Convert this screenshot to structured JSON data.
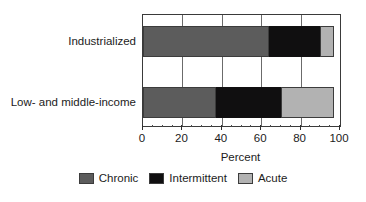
{
  "chart_data": {
    "type": "bar",
    "orientation": "horizontal",
    "stacked": true,
    "title": "",
    "subtitle": "",
    "xlabel": "Percent",
    "ylabel": "",
    "xlim": [
      0,
      100
    ],
    "xticks": [
      0,
      20,
      40,
      60,
      80,
      100
    ],
    "xticklabels": [
      "0",
      "20",
      "40",
      "60",
      "80",
      "100"
    ],
    "minor_tick_step": 5,
    "grid": "vertical-major-only",
    "legend_position": "bottom-center",
    "categories": [
      "Industrialized",
      "Low- and middle-income"
    ],
    "series": [
      {
        "name": "Chronic",
        "color": "#5c5c5c",
        "values": [
          64,
          37
        ]
      },
      {
        "name": "Intermittent",
        "color": "#100f10",
        "values": [
          26,
          33
        ]
      },
      {
        "name": "Acute",
        "color": "#b2b2b2",
        "values": [
          7,
          27
        ]
      }
    ],
    "segment_boundaries": {
      "Industrialized": [
        0,
        64,
        90,
        97
      ],
      "Low- and middle-income": [
        0,
        37,
        70,
        97
      ]
    },
    "totals": [
      97,
      97
    ]
  },
  "axis": {
    "x_title": "Percent",
    "tick_labels": [
      "0",
      "20",
      "40",
      "60",
      "80",
      "100"
    ]
  },
  "categories": {
    "items": [
      {
        "label": "Industrialized"
      },
      {
        "label": "Low- and middle-income"
      }
    ]
  },
  "legend": {
    "items": [
      {
        "label": "Chronic",
        "color": "#5c5c5c"
      },
      {
        "label": "Intermittent",
        "color": "#100f10"
      },
      {
        "label": "Acute",
        "color": "#b2b2b2"
      }
    ]
  },
  "colors": {
    "chronic": "#5c5c5c",
    "intermittent": "#100f10",
    "acute": "#b2b2b2",
    "frame": "#3a3a3a",
    "background": "#ffffff",
    "text": "#1c1c1c"
  }
}
